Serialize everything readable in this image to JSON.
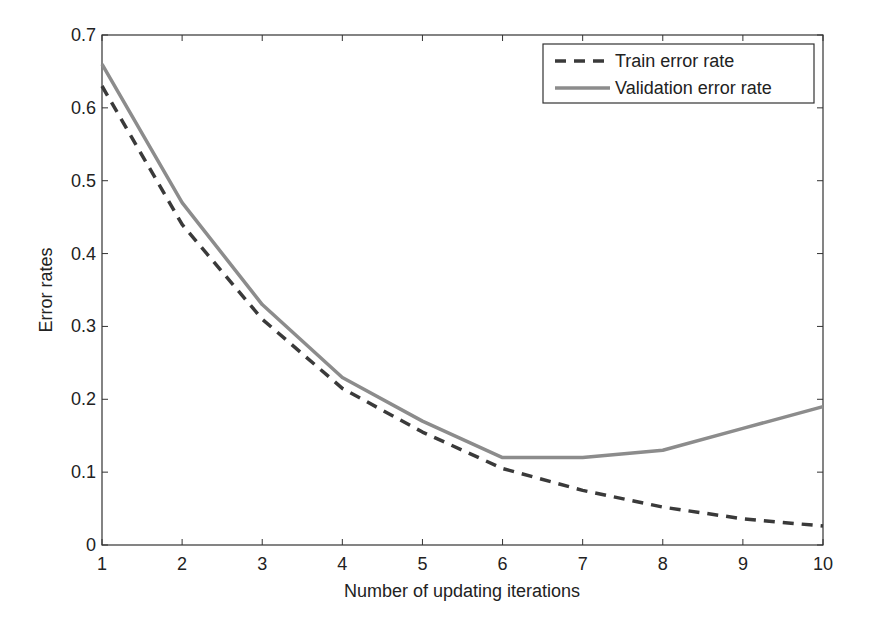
{
  "chart_data": {
    "type": "line",
    "title": "",
    "xlabel": "Number of updating iterations",
    "ylabel": "Error rates",
    "x": [
      1,
      2,
      3,
      4,
      5,
      6,
      7,
      8,
      9,
      10
    ],
    "xlim": [
      1,
      10
    ],
    "ylim": [
      0,
      0.7
    ],
    "xticks": [
      "1",
      "2",
      "3",
      "4",
      "5",
      "6",
      "7",
      "8",
      "9",
      "10"
    ],
    "yticks": [
      "0",
      "0.1",
      "0.2",
      "0.3",
      "0.4",
      "0.5",
      "0.6",
      "0.7"
    ],
    "grid": false,
    "legend_position": "upper right",
    "series": [
      {
        "name": "Train error rate",
        "style": "dashed",
        "color": "#3a3a3a",
        "values": [
          0.63,
          0.44,
          0.31,
          0.215,
          0.155,
          0.105,
          0.075,
          0.052,
          0.036,
          0.026
        ]
      },
      {
        "name": "Validation error rate",
        "style": "solid",
        "color": "#8c8c8c",
        "values": [
          0.66,
          0.47,
          0.33,
          0.23,
          0.17,
          0.12,
          0.12,
          0.13,
          0.16,
          0.19
        ]
      }
    ]
  }
}
